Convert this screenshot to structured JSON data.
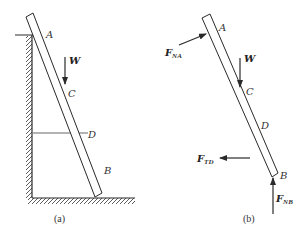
{
  "figure_a": {
    "caption": "(a)",
    "labels": {
      "A": "A",
      "W": "W",
      "C": "C",
      "D": "D",
      "B": "B"
    }
  },
  "figure_b": {
    "caption": "(b)",
    "labels": {
      "A": "A",
      "W": "W",
      "C": "C",
      "D": "D",
      "B": "B",
      "F_NA_main": "F",
      "F_NA_sub": "NA",
      "F_TD_main": "F",
      "F_TD_sub": "TD",
      "F_NB_main": "F",
      "F_NB_sub": "NB"
    }
  },
  "colors": {
    "line": "#2a2a2a",
    "background": "#ffffff"
  }
}
